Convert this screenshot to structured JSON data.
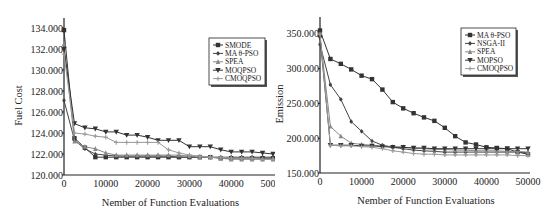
{
  "chart_data": [
    {
      "type": "line",
      "title": "",
      "xlabel": "Nember of Function Evaluations",
      "ylabel": "Fuel Cost",
      "xlim": [
        0,
        50000
      ],
      "ylim": [
        120000,
        134000
      ],
      "x_ticks": [
        "0",
        "10000",
        "20000",
        "30000",
        "40000",
        "50000"
      ],
      "y_ticks": [
        "120.000",
        "122.000",
        "124.000",
        "126.000",
        "128.000",
        "130.000",
        "132.000",
        "134.000"
      ],
      "grid": false,
      "legend_position": "upper right",
      "x": [
        0,
        2500,
        5000,
        7500,
        10000,
        12500,
        15000,
        17500,
        20000,
        22500,
        25000,
        27500,
        30000,
        32500,
        35000,
        37500,
        40000,
        42500,
        45000,
        47500,
        50000
      ],
      "series": [
        {
          "name": "SMODE",
          "marker": "square",
          "color": "#333333",
          "values": [
            133800,
            123500,
            122600,
            121700,
            121700,
            121700,
            121700,
            121700,
            121700,
            121700,
            121700,
            121700,
            121700,
            121700,
            121700,
            121600,
            121600,
            121600,
            121600,
            121600,
            121600
          ]
        },
        {
          "name": "MA θ-PSO",
          "marker": "cross-dot",
          "color": "#444444",
          "values": [
            127100,
            123300,
            122500,
            122000,
            121900,
            121800,
            121800,
            121800,
            121800,
            121800,
            121800,
            121700,
            121700,
            121700,
            121700,
            121700,
            121700,
            121700,
            121700,
            121700,
            121700
          ]
        },
        {
          "name": "SPEA",
          "marker": "triangle",
          "color": "#888888",
          "values": [
            132500,
            123200,
            122700,
            122500,
            122100,
            121900,
            121900,
            121900,
            121900,
            121900,
            121900,
            121900,
            121800,
            121700,
            121700,
            121600,
            121500,
            121500,
            121500,
            121500,
            121500
          ]
        },
        {
          "name": "MOQPSO",
          "marker": "triangle-down",
          "color": "#333333",
          "values": [
            132000,
            124900,
            124500,
            124400,
            124100,
            124100,
            123800,
            123800,
            123600,
            123300,
            123300,
            123300,
            122700,
            122700,
            122700,
            122400,
            122200,
            122200,
            122200,
            122100,
            122000
          ]
        },
        {
          "name": "CMOQPSO",
          "marker": "plus",
          "color": "#9a9a9a",
          "values": [
            131500,
            124000,
            123900,
            123700,
            123600,
            123100,
            123100,
            123100,
            123100,
            123100,
            122400,
            122100,
            121900,
            121800,
            121700,
            121700,
            121600,
            121600,
            121600,
            121500,
            121500
          ]
        }
      ]
    },
    {
      "type": "line",
      "title": "",
      "xlabel": "Nember of Function Evaluations",
      "ylabel": "Emission",
      "xlim": [
        0,
        50000
      ],
      "ylim": [
        150000,
        360000
      ],
      "x_ticks": [
        "0",
        "10000",
        "20000",
        "30000",
        "40000",
        "50000"
      ],
      "y_ticks": [
        "150.000",
        "200.000",
        "250.000",
        "300.000",
        "350.000"
      ],
      "grid": false,
      "legend_position": "upper right",
      "x": [
        0,
        2500,
        5000,
        7500,
        10000,
        12500,
        15000,
        17500,
        20000,
        22500,
        25000,
        27500,
        30000,
        32500,
        35000,
        37500,
        40000,
        42500,
        45000,
        47500,
        50000
      ],
      "series": [
        {
          "name": "MA θ-PSO",
          "marker": "square",
          "color": "#333333",
          "values": [
            355000,
            314000,
            307000,
            299000,
            290000,
            285000,
            270000,
            252000,
            243000,
            236000,
            230000,
            225000,
            215000,
            203000,
            194000,
            191000,
            187000,
            186000,
            185000,
            180000,
            177000
          ]
        },
        {
          "name": "NSGA-II",
          "marker": "cross-dot",
          "color": "#444444",
          "values": [
            335000,
            277000,
            256000,
            224000,
            210000,
            196000,
            190000,
            187000,
            185000,
            183000,
            182000,
            181000,
            180000,
            180000,
            180000,
            180000,
            180000,
            180000,
            180000,
            180000,
            179000
          ]
        },
        {
          "name": "SPEA",
          "marker": "triangle",
          "color": "#888888",
          "values": [
            348000,
            217000,
            203000,
            193000,
            191000,
            190000,
            189000,
            188000,
            187000,
            186000,
            185000,
            184000,
            184000,
            183000,
            183000,
            182000,
            182000,
            182000,
            181000,
            181000,
            180000
          ]
        },
        {
          "name": "MOPSO",
          "marker": "triangle-down",
          "color": "#333333",
          "values": [
            345000,
            190000,
            190000,
            190000,
            189000,
            189000,
            188000,
            187000,
            187000,
            186000,
            186000,
            185000,
            185000,
            185000,
            185000,
            185000,
            185000,
            185000,
            185000,
            185000,
            185000
          ]
        },
        {
          "name": "CMOQPSO",
          "marker": "plus",
          "color": "#9a9a9a",
          "values": [
            350000,
            190000,
            189000,
            189000,
            188000,
            187000,
            185000,
            182000,
            180000,
            178000,
            177000,
            177000,
            176000,
            176000,
            176000,
            176000,
            176000,
            176000,
            176000,
            175000,
            175000
          ]
        }
      ]
    }
  ]
}
